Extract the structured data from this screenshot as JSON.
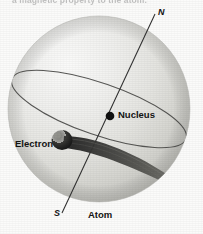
{
  "figure": {
    "caption_partial": "a magnetic property to the atom.",
    "background_color": "#fbfbfa"
  },
  "labels": {
    "north_pole": "N",
    "south_pole": "S",
    "nucleus": "Nucleus",
    "electron": "Electron",
    "atom": "Atom"
  },
  "colors": {
    "sphere_light": "#f2f2f0",
    "sphere_mid": "#dededa",
    "sphere_dark": "#c4c4c0",
    "nucleus": "#111111",
    "electron": "#2a2a2a",
    "line": "#3b3b3b",
    "text": "#141414",
    "caption": "#b9b9b9"
  },
  "geometry": {
    "sphere_center_x": 99,
    "sphere_center_y": 109,
    "sphere_radius_x": 91,
    "sphere_radius_y": 93,
    "axis_north_x": 155,
    "axis_north_y": 12,
    "axis_south_x": 62,
    "axis_south_y": 214,
    "nucleus_x": 110,
    "nucleus_y": 116,
    "nucleus_r": 4.2,
    "electron_x": 62,
    "electron_y": 141,
    "electron_r": 9.5
  }
}
